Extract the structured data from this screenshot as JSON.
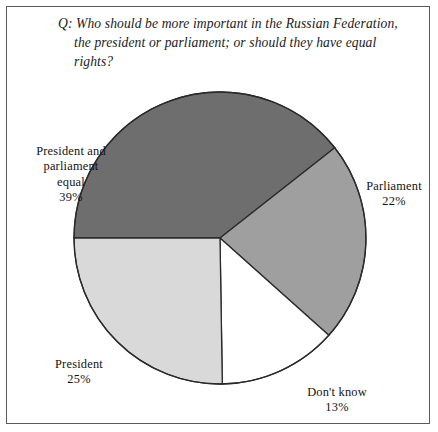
{
  "figure": {
    "question": "Q: Who should be more important in the Russian Federation, the president or parliament; or should they have equal rights?"
  },
  "labels": {
    "equal": {
      "name": "President and\nparliament\nequal",
      "value": "39%"
    },
    "parliament": {
      "name": "Parliament",
      "value": "22%"
    },
    "president": {
      "name": "President",
      "value": "25%"
    },
    "dontknow": {
      "name": "Don't know",
      "value": "13%"
    }
  },
  "colors": {
    "equal": "#6e6e6e",
    "parliament": "#9f9f9f",
    "president": "#d9d9d9",
    "dontknow": "#ffffff",
    "outline": "#2a2a2a",
    "frame": "#5a5a5a",
    "background": "#ffffff",
    "text": "#131313"
  },
  "chart_data": {
    "type": "pie",
    "title": "Q: Who should be more important in the Russian Federation, the president or parliament; or should they have equal rights?",
    "xlabel": "",
    "ylabel": "",
    "legend_position": "none",
    "grid": false,
    "units": "percent",
    "categories": [
      "President and parliament equal",
      "Parliament",
      "Don't know",
      "President"
    ],
    "values": [
      39,
      22,
      13,
      25
    ],
    "labels_text": [
      "39%",
      "22%",
      "13%",
      "25%"
    ],
    "slice_colors": [
      "#6e6e6e",
      "#9f9f9f",
      "#ffffff",
      "#d9d9d9"
    ],
    "start_angle_deg": 270,
    "direction": "clockwise",
    "geometry": {
      "cx": 220,
      "cy": 238,
      "r": 146
    },
    "slices": [
      {
        "category": "President and parliament equal",
        "value": 39,
        "label": "39%",
        "color": "#6e6e6e",
        "start_deg": 270,
        "end_deg": 410.4
      },
      {
        "category": "Parliament",
        "value": 22,
        "label": "22%",
        "color": "#9f9f9f",
        "start_deg": 50.4,
        "end_deg": 129.6
      },
      {
        "category": "Don't know",
        "value": 13,
        "label": "13%",
        "color": "#ffffff",
        "start_deg": 129.6,
        "end_deg": 176.4
      },
      {
        "category": "President",
        "value": 25,
        "label": "25%",
        "color": "#d9d9d9",
        "start_deg": 176.4,
        "end_deg": 270
      }
    ]
  }
}
